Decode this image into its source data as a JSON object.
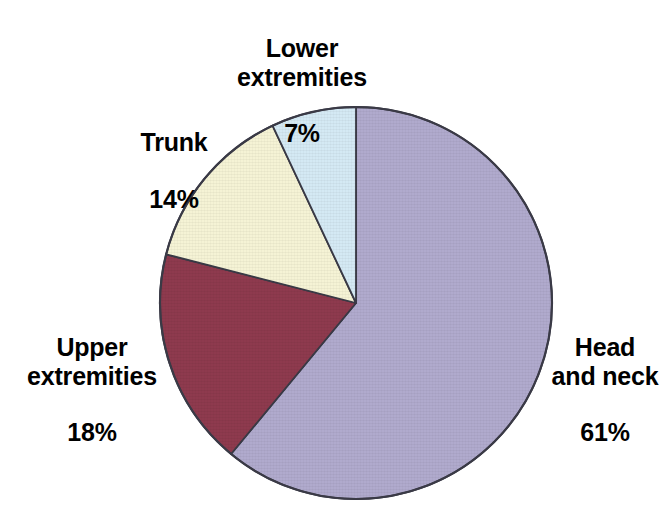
{
  "chart_data": {
    "type": "pie",
    "title": "",
    "subtitle": "",
    "xlabel": "",
    "ylabel": "",
    "legend_position": "none",
    "grid": false,
    "unit": "%",
    "start_angle_deg": 0,
    "direction": "clockwise",
    "categories": [
      "Head and neck",
      "Upper extremities",
      "Trunk",
      "Lower extremities"
    ],
    "values": [
      61,
      18,
      14,
      7
    ],
    "slices": [
      {
        "label": "Head and neck",
        "label_line1": "Head",
        "label_line2": "and neck",
        "value": 61,
        "value_text": "61%",
        "color": "#b0aacd",
        "start_deg": 0,
        "end_deg": 219.6
      },
      {
        "label": "Upper extremities",
        "label_line1": "Upper",
        "label_line2": "extremities",
        "value": 18,
        "value_text": "18%",
        "color": "#8e3a4e",
        "start_deg": 219.6,
        "end_deg": 284.4
      },
      {
        "label": "Trunk",
        "label_line1": "Trunk",
        "label_line2": "",
        "value": 14,
        "value_text": "14%",
        "color": "#f5f3d5",
        "start_deg": 284.4,
        "end_deg": 334.8
      },
      {
        "label": "Lower extremities",
        "label_line1": "Lower",
        "label_line2": "extremities",
        "value": 7,
        "value_text": "7%",
        "color": "#d4e9f4",
        "start_deg": 334.8,
        "end_deg": 360
      }
    ]
  },
  "figure": {
    "background_color": "#ffffff",
    "outline_color": "#3a3a46",
    "text_color": "#000000",
    "center_x": 356,
    "center_y": 303,
    "radius": 196
  },
  "labels": {
    "lower": {
      "name": "Lower\nextremities",
      "value": "7%"
    },
    "trunk": {
      "name": "Trunk",
      "value": "14%"
    },
    "upper": {
      "name": "Upper\nextremities",
      "value": "18%"
    },
    "head": {
      "name": "Head\nand neck",
      "value": "61%"
    }
  }
}
